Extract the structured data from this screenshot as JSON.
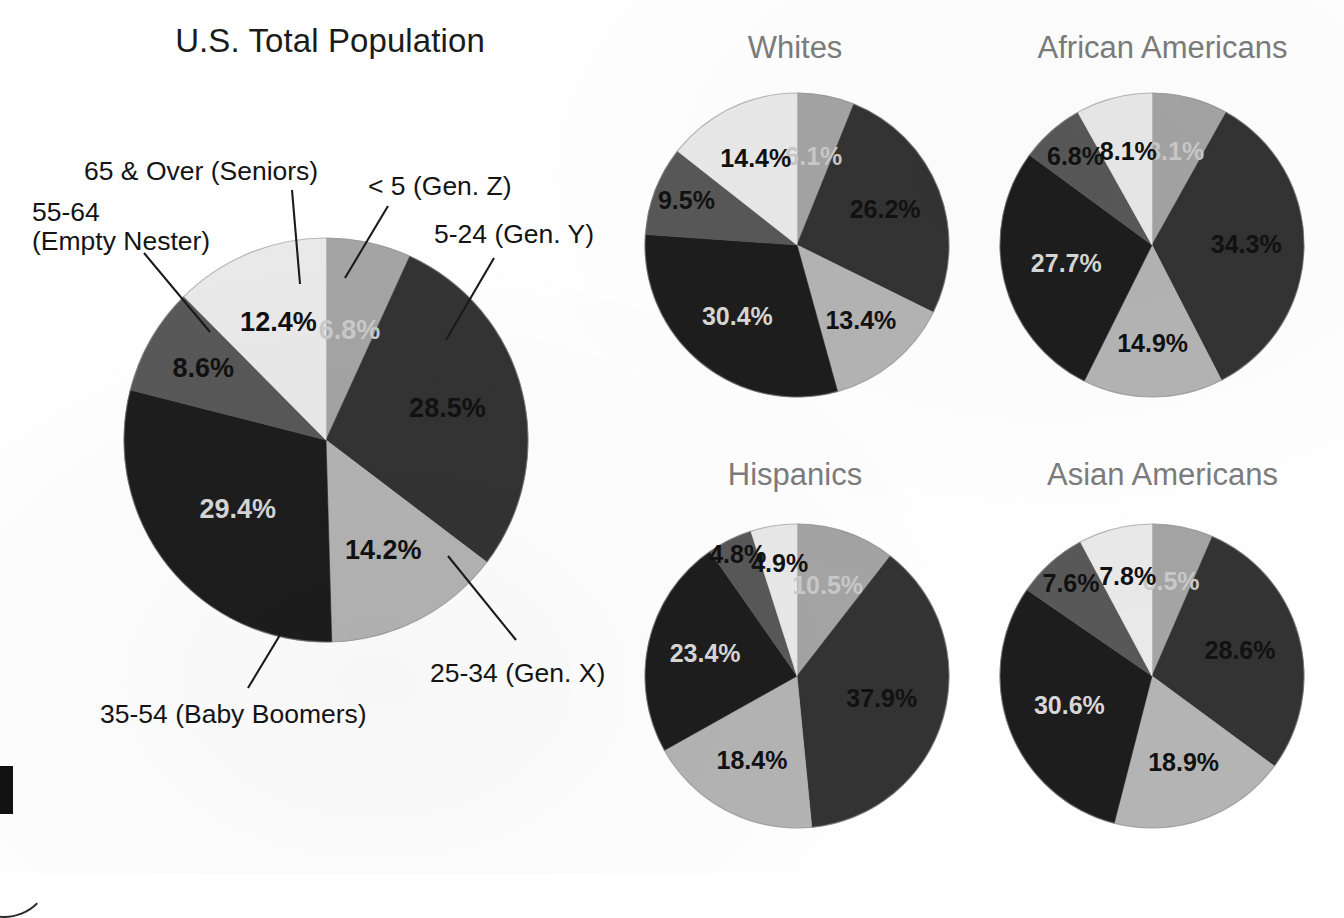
{
  "page": {
    "background": "#ffffff",
    "title_color": "#1b1b1b",
    "subtitle_color": "#7c7c7c"
  },
  "titles": {
    "main": "U.S. Total Population",
    "whites": "Whites",
    "african_americans": "African Americans",
    "hispanics": "Hispanics",
    "asian_americans": "Asian Americans"
  },
  "callouts": {
    "seniors": "65 & Over (Seniors)",
    "empty_nester_line1": "55-64",
    "empty_nester_line2": "(Empty Nester)",
    "gen_z": "< 5 (Gen. Z)",
    "gen_y": "5-24 (Gen. Y)",
    "gen_x": "25-34 (Gen. X)",
    "baby_boomers": "35-54 (Baby Boomers)"
  },
  "palette": {
    "lt5": "#a4a4a4",
    "a5_24": "#333333",
    "a25_34": "#b4b4b4",
    "a35_54": "#1d1d1d",
    "a55_64": "#585858",
    "a65_over": "#e9e9e9",
    "label_dark": "#111111",
    "label_light": "#d7d7d7",
    "label_mid": "#bdbdbd",
    "outline": "#8c8c8c"
  },
  "chart_data": [
    {
      "type": "pie",
      "title": "U.S. Total Population",
      "id": "us-total",
      "categories": [
        "< 5 (Gen. Z)",
        "5-24 (Gen. Y)",
        "25-34 (Gen. X)",
        "35-54 (Baby Boomers)",
        "55-64 (Empty Nester)",
        "65 & Over (Seniors)"
      ],
      "values": [
        6.8,
        28.5,
        14.2,
        29.4,
        8.6,
        12.4
      ],
      "labels": [
        "6.8%",
        "28.5%",
        "14.2%",
        "29.4%",
        "8.6%",
        "12.4%"
      ],
      "colors": [
        "#a4a4a4",
        "#333333",
        "#b4b4b4",
        "#1d1d1d",
        "#585858",
        "#e9e9e9"
      ],
      "label_colors": [
        "#c9c9c9",
        "#111111",
        "#111111",
        "#d7d7d7",
        "#111111",
        "#111111"
      ],
      "start_angle": 0,
      "direction": "clockwise",
      "legend": "callouts"
    },
    {
      "type": "pie",
      "title": "Whites",
      "id": "whites",
      "categories": [
        "< 5 (Gen. Z)",
        "5-24 (Gen. Y)",
        "25-34 (Gen. X)",
        "35-54 (Baby Boomers)",
        "55-64 (Empty Nester)",
        "65 & Over (Seniors)"
      ],
      "values": [
        6.1,
        26.2,
        13.4,
        30.4,
        9.5,
        14.4
      ],
      "labels": [
        "6.1%",
        "26.2%",
        "13.4%",
        "30.4%",
        "9.5%",
        "14.4%"
      ],
      "colors": [
        "#a4a4a4",
        "#333333",
        "#b4b4b4",
        "#1d1d1d",
        "#585858",
        "#e9e9e9"
      ],
      "label_colors": [
        "#c9c9c9",
        "#111111",
        "#111111",
        "#d7d7d7",
        "#111111",
        "#111111"
      ],
      "start_angle": 0,
      "direction": "clockwise"
    },
    {
      "type": "pie",
      "title": "African Americans",
      "id": "african-americans",
      "categories": [
        "< 5 (Gen. Z)",
        "5-24 (Gen. Y)",
        "25-34 (Gen. X)",
        "35-54 (Baby Boomers)",
        "55-64 (Empty Nester)",
        "65 & Over (Seniors)"
      ],
      "values": [
        8.1,
        34.3,
        14.9,
        27.7,
        6.8,
        8.1
      ],
      "labels": [
        "8.1%",
        "34.3%",
        "14.9%",
        "27.7%",
        "6.8%",
        "8.1%"
      ],
      "colors": [
        "#a4a4a4",
        "#333333",
        "#b4b4b4",
        "#1d1d1d",
        "#585858",
        "#e9e9e9"
      ],
      "label_colors": [
        "#c9c9c9",
        "#111111",
        "#111111",
        "#d7d7d7",
        "#111111",
        "#111111"
      ],
      "start_angle": 0,
      "direction": "clockwise"
    },
    {
      "type": "pie",
      "title": "Hispanics",
      "id": "hispanics",
      "categories": [
        "< 5 (Gen. Z)",
        "5-24 (Gen. Y)",
        "25-34 (Gen. X)",
        "35-54 (Baby Boomers)",
        "55-64 (Empty Nester)",
        "65 & Over (Seniors)"
      ],
      "values": [
        10.5,
        37.9,
        18.4,
        23.4,
        4.8,
        4.9
      ],
      "labels": [
        "10.5%",
        "37.9%",
        "18.4%",
        "23.4%",
        "4.8%",
        "4.9%"
      ],
      "colors": [
        "#a4a4a4",
        "#333333",
        "#b4b4b4",
        "#1d1d1d",
        "#585858",
        "#e9e9e9"
      ],
      "label_colors": [
        "#c9c9c9",
        "#111111",
        "#111111",
        "#d7d7d7",
        "#111111",
        "#111111"
      ],
      "start_angle": 0,
      "direction": "clockwise"
    },
    {
      "type": "pie",
      "title": "Asian Americans",
      "id": "asian-americans",
      "categories": [
        "< 5 (Gen. Z)",
        "5-24 (Gen. Y)",
        "25-34 (Gen. X)",
        "35-54 (Baby Boomers)",
        "55-64 (Empty Nester)",
        "65 & Over (Seniors)"
      ],
      "values": [
        6.5,
        28.6,
        18.9,
        30.6,
        7.6,
        7.8
      ],
      "labels": [
        "6.5%",
        "28.6%",
        "18.9%",
        "30.6%",
        "7.6%",
        "7.8%"
      ],
      "colors": [
        "#a4a4a4",
        "#333333",
        "#b4b4b4",
        "#1d1d1d",
        "#585858",
        "#e9e9e9"
      ],
      "label_colors": [
        "#c9c9c9",
        "#111111",
        "#111111",
        "#d7d7d7",
        "#111111",
        "#111111"
      ],
      "start_angle": 0,
      "direction": "clockwise"
    }
  ],
  "geometry": {
    "us-total": {
      "cx": 326,
      "cy": 440,
      "r": 202,
      "font": 27,
      "label_r": 0.62
    },
    "whites": {
      "cx": 797,
      "cy": 245,
      "r": 152,
      "font": 25,
      "label_r": 0.64
    },
    "african-americans": {
      "cx": 1152,
      "cy": 245,
      "r": 152,
      "font": 25,
      "label_r": 0.64
    },
    "hispanics": {
      "cx": 797,
      "cy": 676,
      "r": 152,
      "font": 25,
      "label_r": 0.64
    },
    "asian-americans": {
      "cx": 1152,
      "cy": 676,
      "r": 152,
      "font": 25,
      "label_r": 0.64
    }
  },
  "label_overrides": {
    "us-total": [
      {
        "i": 0,
        "rf": 0.55
      },
      {
        "i": 1,
        "rf": 0.62
      },
      {
        "i": 2,
        "rf": 0.62
      },
      {
        "i": 3,
        "rf": 0.56
      },
      {
        "i": 4,
        "rf": 0.7
      },
      {
        "i": 5,
        "rf": 0.62
      }
    ],
    "whites": [
      {
        "i": 0,
        "rf": 0.58
      },
      {
        "i": 1,
        "rf": 0.62
      },
      {
        "i": 2,
        "rf": 0.66
      },
      {
        "i": 3,
        "rf": 0.62
      },
      {
        "i": 4,
        "rf": 0.78
      },
      {
        "i": 5,
        "rf": 0.62
      }
    ],
    "african-americans": [
      {
        "i": 0,
        "rf": 0.62
      },
      {
        "i": 1,
        "rf": 0.62
      },
      {
        "i": 2,
        "rf": 0.66
      },
      {
        "i": 3,
        "rf": 0.58
      },
      {
        "i": 4,
        "rf": 0.76
      },
      {
        "i": 5,
        "rf": 0.62
      }
    ],
    "hispanics": [
      {
        "i": 0,
        "rf": 0.62
      },
      {
        "i": 1,
        "rf": 0.58
      },
      {
        "i": 2,
        "rf": 0.64
      },
      {
        "i": 3,
        "rf": 0.62
      },
      {
        "i": 4,
        "rf": 0.88
      },
      {
        "i": 5,
        "rf": 0.74
      }
    ],
    "asian-americans": [
      {
        "i": 0,
        "rf": 0.62
      },
      {
        "i": 1,
        "rf": 0.6
      },
      {
        "i": 2,
        "rf": 0.62
      },
      {
        "i": 3,
        "rf": 0.58
      },
      {
        "i": 4,
        "rf": 0.8
      },
      {
        "i": 5,
        "rf": 0.66
      }
    ]
  },
  "leaders": [
    {
      "name": "leader-seniors",
      "x1": 292,
      "y1": 190,
      "x2": 300,
      "y2": 284
    },
    {
      "name": "leader-empty-nester",
      "x1": 144,
      "y1": 253,
      "x2": 210,
      "y2": 332
    },
    {
      "name": "leader-gen-z",
      "x1": 388,
      "y1": 206,
      "x2": 345,
      "y2": 278
    },
    {
      "name": "leader-gen-y",
      "x1": 494,
      "y1": 258,
      "x2": 446,
      "y2": 340
    },
    {
      "name": "leader-gen-x",
      "x1": 516,
      "y1": 640,
      "x2": 448,
      "y2": 556
    },
    {
      "name": "leader-baby-boomers",
      "x1": 248,
      "y1": 688,
      "x2": 283,
      "y2": 630
    }
  ]
}
